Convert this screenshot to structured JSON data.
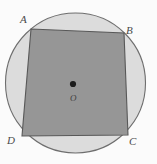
{
  "figure": {
    "name": "cyclic-quadrilateral-in-circle",
    "canvas": {
      "width": 157,
      "height": 164
    },
    "background_color": "#fbfbfb",
    "circle": {
      "name": "circumscribed-circle",
      "cx": 75.5,
      "cy": 83,
      "r": 70,
      "fill": "#dcdcdc",
      "stroke": "#6e6e6e",
      "stroke_width": 1.1
    },
    "quadrilateral": {
      "name": "inscribed-quadrilateral",
      "fill": "#969696",
      "stroke": "#585858",
      "stroke_width": 1.1,
      "points": "31,29 124,33 128,135 22,136",
      "vertices": [
        {
          "id": "A",
          "label": "A",
          "x": 31,
          "y": 29,
          "label_x": 20,
          "label_y": 14
        },
        {
          "id": "B",
          "label": "B",
          "x": 124,
          "y": 33,
          "label_x": 126,
          "label_y": 25
        },
        {
          "id": "C",
          "label": "C",
          "x": 128,
          "y": 135,
          "label_x": 129,
          "label_y": 136
        },
        {
          "id": "D",
          "label": "D",
          "x": 22,
          "y": 136,
          "label_x": 7,
          "label_y": 135
        }
      ]
    },
    "center": {
      "name": "circle-center",
      "label": "O",
      "x": 73,
      "y": 84,
      "dot_radius": 3.1,
      "dot_color": "#1c1c1c",
      "label_x": 70,
      "label_y": 94
    }
  }
}
